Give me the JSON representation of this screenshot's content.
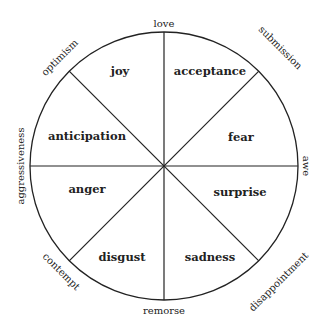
{
  "diagram": {
    "type": "emotion-wheel",
    "center": [
      164,
      166
    ],
    "radius": 134,
    "line_color": "#222222",
    "primary_emotions": [
      {
        "label": "joy",
        "x": 120,
        "y": 75
      },
      {
        "label": "acceptance",
        "x": 210,
        "y": 75
      },
      {
        "label": "fear",
        "x": 241,
        "y": 141
      },
      {
        "label": "surprise",
        "x": 240,
        "y": 196
      },
      {
        "label": "sadness",
        "x": 210,
        "y": 261
      },
      {
        "label": "disgust",
        "x": 122,
        "y": 261
      },
      {
        "label": "anger",
        "x": 87,
        "y": 193
      },
      {
        "label": "anticipation",
        "x": 87,
        "y": 140
      }
    ],
    "dyads": [
      {
        "label": "love",
        "x": 164,
        "y": 27,
        "rotate": 0
      },
      {
        "label": "submission",
        "x": 278,
        "y": 50,
        "rotate": 45
      },
      {
        "label": "awe",
        "x": 306,
        "y": 166,
        "rotate": 90
      },
      {
        "label": "disappointment",
        "x": 278,
        "y": 283,
        "rotate": -45
      },
      {
        "label": "remorse",
        "x": 164,
        "y": 314,
        "rotate": 0
      },
      {
        "label": "contempt",
        "x": 55,
        "y": 277,
        "rotate": 45
      },
      {
        "label": "aggressiveness",
        "x": 22,
        "y": 166,
        "rotate": -90
      },
      {
        "label": "optimism",
        "x": 56,
        "y": 57,
        "rotate": -45
      }
    ]
  }
}
